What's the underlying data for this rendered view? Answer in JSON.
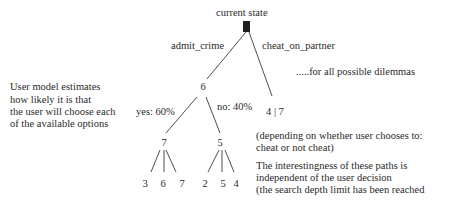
{
  "diagram": {
    "root": {
      "label": "current state"
    },
    "branches": {
      "left_label": "admit_crime",
      "right_label": "cheat_on_partner"
    },
    "nodes": {
      "admit_value": "6",
      "cheat_value": "4 | 7",
      "yes_value": "7",
      "no_value": "5",
      "yes_children": [
        "3",
        "6",
        "7"
      ],
      "no_children": [
        "2",
        "5",
        "4"
      ]
    },
    "probabilities": {
      "yes": "yes: 60%",
      "no": "no: 40%"
    },
    "annotations": {
      "all_dilemmas": ".....for all possible dilemmas",
      "user_model": [
        "User model estimates",
        "how likely it is that",
        "the user will choose each",
        "of the available options"
      ],
      "depending": [
        "(depending on whether user chooses to:",
        "cheat or not cheat)"
      ],
      "interestingness": [
        "The interestingness of these paths is",
        "independent of the user decision",
        "(the search depth limit has been reached"
      ]
    }
  }
}
